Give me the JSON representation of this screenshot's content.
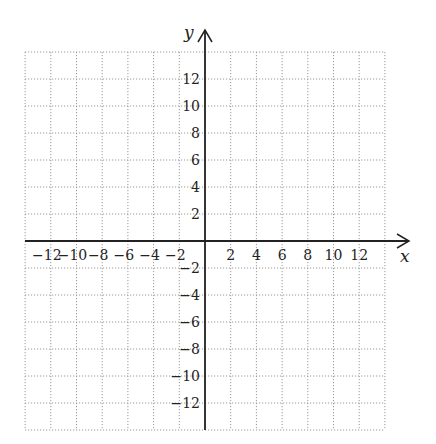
{
  "diagram": {
    "type": "coordinate-plane",
    "x_axis": {
      "label": "x",
      "min": -14,
      "max": 14,
      "tick_step": 2,
      "tick_labels": [
        "-12",
        "-10",
        "-8",
        "-6",
        "-4",
        "-2",
        "2",
        "4",
        "6",
        "8",
        "10",
        "12"
      ]
    },
    "y_axis": {
      "label": "y",
      "min": -14,
      "max": 14,
      "tick_step": 2,
      "tick_labels": [
        "12",
        "10",
        "8",
        "6",
        "4",
        "2",
        "-2",
        "-4",
        "-6",
        "-8",
        "-10",
        "-12"
      ]
    },
    "grid": {
      "style": "dotted",
      "cells_x": 14,
      "cells_y": 14,
      "color": "#999999"
    },
    "colors": {
      "axis": "#222222",
      "grid": "#9a9a9a",
      "background": "#ffffff"
    }
  }
}
